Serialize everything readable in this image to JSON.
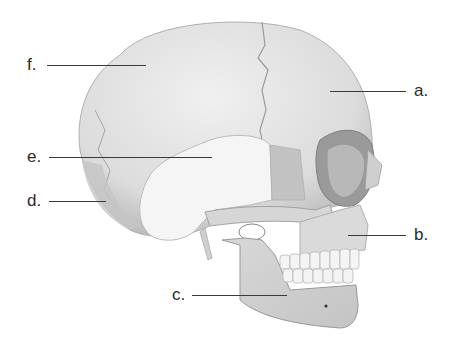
{
  "figure": {
    "labels": [
      {
        "key": "a",
        "text": "a.",
        "x": 414,
        "y": 91,
        "line": [
          330,
          406,
          91
        ]
      },
      {
        "key": "b",
        "text": "b.",
        "x": 414,
        "y": 235,
        "line": [
          348,
          406,
          235
        ]
      },
      {
        "key": "c",
        "text": "c.",
        "x": 172,
        "y": 295,
        "line": [
          192,
          287,
          295
        ]
      },
      {
        "key": "d",
        "text": "d.",
        "x": 27,
        "y": 201,
        "line": [
          49,
          106,
          201
        ]
      },
      {
        "key": "e",
        "text": "e.",
        "x": 27,
        "y": 157,
        "line": [
          49,
          212,
          157
        ]
      },
      {
        "key": "f",
        "text": "f.",
        "x": 27,
        "y": 65,
        "line": [
          47,
          146,
          65
        ]
      }
    ]
  },
  "colors": {
    "background": "#ffffff",
    "bone_light": "#ececec",
    "bone_mid": "#d2d2d2",
    "bone_shadow": "#a8a8a8",
    "temporal_highlight": "#f4f4f4",
    "text": "#2a2a2a",
    "leader_line": "#3a3a3a"
  }
}
